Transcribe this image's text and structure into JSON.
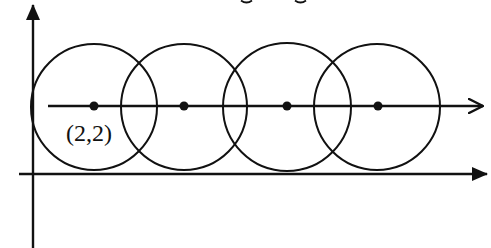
{
  "diagram": {
    "type": "geometry-figure",
    "stroke_color": "#111111",
    "background_color": "#ffffff",
    "axes": {
      "y_axis": {
        "x": 33,
        "y_top": 4,
        "y_bottom": 248,
        "arrow": "filled"
      },
      "x_axis": {
        "y": 174,
        "x_left": 19,
        "x_right": 487,
        "arrow": "filled"
      }
    },
    "center_line": {
      "y": 106,
      "x_left": 48,
      "x_right": 483,
      "arrow": "open-chevron"
    },
    "circles": [
      {
        "cx": 94,
        "cy": 107,
        "r": 63
      },
      {
        "cx": 184,
        "cy": 107,
        "r": 63
      },
      {
        "cx": 287,
        "cy": 107,
        "r": 64
      },
      {
        "cx": 377,
        "cy": 107,
        "r": 63
      }
    ],
    "center_points": [
      {
        "x": 94,
        "y": 106
      },
      {
        "x": 184,
        "y": 106
      },
      {
        "x": 287,
        "y": 106
      },
      {
        "x": 378,
        "y": 106
      }
    ],
    "labels": {
      "first_center": "(2,2)"
    }
  }
}
